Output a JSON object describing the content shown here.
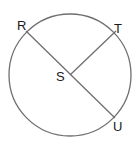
{
  "diagram": {
    "type": "circle-geometry",
    "circle": {
      "center": "S",
      "cx": 70,
      "cy": 75,
      "r": 61,
      "stroke": "#6f6f6f"
    },
    "points": [
      {
        "id": "R",
        "label": "R",
        "x": 26,
        "y": 31,
        "lx": 17,
        "ly": 30
      },
      {
        "id": "T",
        "label": "T",
        "x": 116,
        "y": 31,
        "lx": 114,
        "ly": 33
      },
      {
        "id": "S",
        "label": "S",
        "x": 70,
        "y": 75,
        "lx": 56,
        "ly": 81
      },
      {
        "id": "U",
        "label": "U",
        "x": 115,
        "y": 118,
        "lx": 113,
        "ly": 131
      }
    ],
    "segments": [
      {
        "name": "diameter-RU",
        "from": "R",
        "to": "U"
      },
      {
        "name": "radius-ST",
        "from": "S",
        "to": "T"
      }
    ],
    "line_color": "#6f6f6f"
  }
}
